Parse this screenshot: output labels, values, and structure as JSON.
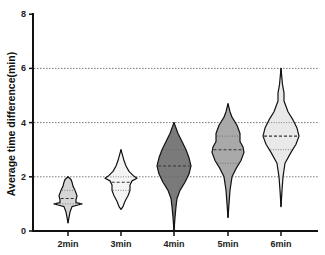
{
  "chart_data": {
    "type": "violin",
    "title": "",
    "xlabel": "",
    "ylabel": "Average time difference(min)",
    "ylim": [
      0,
      8
    ],
    "yticks": [
      0,
      2,
      4,
      6,
      8
    ],
    "ytick_labels": [
      "0",
      "2",
      "4",
      "6",
      "8"
    ],
    "grid": {
      "horizontal_dotted_at": [
        2,
        4,
        6
      ]
    },
    "categories": [
      "2min",
      "3min",
      "4min",
      "5min",
      "6min"
    ],
    "series": [
      {
        "name": "2min",
        "min": 0.3,
        "q1": 1.0,
        "median": 1.2,
        "q3": 1.5,
        "max": 2.0,
        "mode": 1.0,
        "fill": "#d6d6d6"
      },
      {
        "name": "3min",
        "min": 0.8,
        "q1": 1.5,
        "median": 1.8,
        "q3": 2.0,
        "max": 3.0,
        "mode": 2.0,
        "fill": "#f4f4f4"
      },
      {
        "name": "4min",
        "min": 0.0,
        "q1": 2.0,
        "median": 2.4,
        "q3": 3.0,
        "max": 4.0,
        "mode": 2.3,
        "fill": "#7a7a7a"
      },
      {
        "name": "5min",
        "min": 0.5,
        "q1": 2.5,
        "median": 3.0,
        "q3": 3.5,
        "max": 4.7,
        "mode": 3.0,
        "fill": "#a9a9a9"
      },
      {
        "name": "6min",
        "min": 0.9,
        "q1": 3.0,
        "median": 3.5,
        "q3": 4.0,
        "max": 6.0,
        "mode": 3.5,
        "fill": "#e9e9e9"
      }
    ],
    "legend": null
  }
}
